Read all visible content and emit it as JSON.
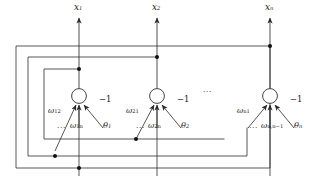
{
  "diagram": {
    "type": "hopfield-recurrent-neural-network",
    "neurons": [
      {
        "id": "neuron-1",
        "output_label": "x",
        "output_sub": "1",
        "weight_left": "ω",
        "weight_left_sub": "12",
        "weight_right": "ω",
        "weight_right_sub": "1n",
        "bias_input": "−1",
        "threshold": "θ",
        "threshold_sub": "1",
        "ellipsis": "..."
      },
      {
        "id": "neuron-2",
        "output_label": "x",
        "output_sub": "2",
        "weight_left": "ω",
        "weight_left_sub": "21",
        "weight_right": "ω",
        "weight_right_sub": "2n",
        "bias_input": "−1",
        "threshold": "θ",
        "threshold_sub": "2",
        "ellipsis": "..."
      },
      {
        "id": "neuron-n",
        "output_label": "x",
        "output_sub": "n",
        "weight_left": "ω",
        "weight_left_sub": "n1",
        "weight_right": "ω",
        "weight_right_sub": "n,n−1",
        "bias_input": "−1",
        "threshold": "θ",
        "threshold_sub": "n",
        "ellipsis": "..."
      }
    ],
    "inter_neuron_ellipsis": "...",
    "colors": {
      "line": "#3a3a3a",
      "node": "#1a1a1a",
      "text": "#1a1a1a",
      "background": "#ffffff"
    }
  }
}
